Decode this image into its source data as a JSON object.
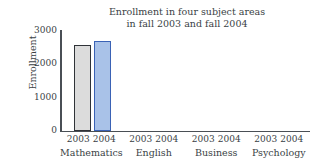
{
  "chart_data": {
    "type": "bar",
    "title": "Enrollment in four subject areas in fall 2003 and fall 2004",
    "title_line1": "Enrollment in four subject areas",
    "title_line2": "in fall 2003 and fall 2004",
    "xlabel": "",
    "ylabel": "Enrollment",
    "ylim": [
      0,
      3000
    ],
    "yticks": [
      "0",
      "1000",
      "2000",
      "3000"
    ],
    "ytick_values": [
      0,
      1000,
      2000,
      3000
    ],
    "grid": false,
    "legend": "none",
    "categories": [
      "Mathematics",
      "English",
      "Business",
      "Psychology"
    ],
    "series": [
      {
        "name": "2003",
        "color": "#dcdcdc",
        "border_color": "#2f3338",
        "values": [
          2550,
          null,
          null,
          null
        ]
      },
      {
        "name": "2004",
        "color": "#a9c2e8",
        "border_color": "#3a62b5",
        "values": [
          2680,
          null,
          null,
          null
        ]
      }
    ],
    "group_year_labels": [
      "2003",
      "2004"
    ]
  },
  "axis": {
    "y_title": "Enrollment",
    "tick_3000": "3000",
    "tick_2000": "2000",
    "tick_1000": "1000",
    "tick_0": "0"
  },
  "groups": [
    {
      "category": "Mathematics",
      "year_a": "2003",
      "year_b": "2004"
    },
    {
      "category": "English",
      "year_a": "2003",
      "year_b": "2004"
    },
    {
      "category": "Business",
      "year_a": "2003",
      "year_b": "2004"
    },
    {
      "category": "Psychology",
      "year_a": "2003",
      "year_b": "2004"
    }
  ]
}
